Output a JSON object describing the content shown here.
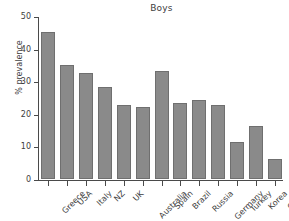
{
  "chart_data": {
    "type": "bar",
    "title": "Boys",
    "xlabel": "",
    "ylabel": "% prevalence",
    "categories": [
      "Greece",
      "USA",
      "Italy",
      "NZ",
      "UK",
      "Australia",
      "Spain",
      "Brazil",
      "Russia",
      "Germany",
      "Turkey",
      "Korea",
      "China"
    ],
    "values": [
      45.0,
      35.0,
      32.4,
      28.1,
      22.7,
      22.0,
      33.0,
      23.2,
      24.2,
      22.7,
      11.3,
      16.2,
      6.0
    ],
    "ylim": [
      0,
      50
    ],
    "ytick_values": [
      0,
      10,
      20,
      30,
      40,
      50
    ],
    "ytick_labels": [
      "0",
      "10",
      "20",
      "30",
      "40",
      "50"
    ],
    "grid": false,
    "legend": null,
    "bar_color": "#8a8a8a",
    "bar_edge_color": "#6f6f6f",
    "axis_color": "#4a4a4a",
    "text_color": "#3d3d3d",
    "background_color": "#ffffff"
  }
}
